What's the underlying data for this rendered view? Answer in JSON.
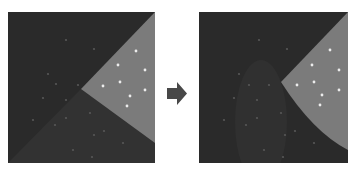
{
  "diagram": {
    "type": "before-after-transition",
    "colors": {
      "page_background": "#ffffff",
      "dark_region": "#2a2a2a",
      "dark_region_alt": "#323232",
      "wedge": "#7b7b7b",
      "bright_dot": "#ececec",
      "dim_dot": "#575757",
      "arrow": "#484848"
    },
    "left_panel": {
      "name": "before",
      "wedge_polygon": [
        [
          73,
          77
        ],
        [
          147,
          0
        ],
        [
          147,
          131
        ]
      ],
      "lower_region_polygon": [
        [
          0,
          151
        ],
        [
          73,
          77
        ],
        [
          147,
          131
        ],
        [
          147,
          151
        ]
      ],
      "bright_dots": [
        [
          128,
          39
        ],
        [
          110,
          53
        ],
        [
          137,
          58
        ],
        [
          95,
          74
        ],
        [
          112,
          70
        ],
        [
          137,
          78
        ],
        [
          122,
          84
        ],
        [
          119,
          94
        ]
      ],
      "dim_dots": [
        [
          58,
          28
        ],
        [
          86,
          37
        ],
        [
          40,
          62
        ],
        [
          48,
          72
        ],
        [
          70,
          73
        ],
        [
          58,
          88
        ],
        [
          35,
          86
        ],
        [
          82,
          101
        ],
        [
          58,
          106
        ],
        [
          47,
          113
        ],
        [
          96,
          119
        ],
        [
          86,
          123
        ],
        [
          115,
          131
        ],
        [
          65,
          138
        ],
        [
          84,
          145
        ],
        [
          25,
          108
        ]
      ]
    },
    "arrow": {
      "direction": "right",
      "label": ""
    },
    "right_panel": {
      "name": "after",
      "wedge_vertex": [
        82,
        70
      ],
      "wedge_curve_end": [
        149,
        138
      ],
      "blob_ellipse": {
        "cx": 62,
        "cy": 110,
        "rx": 26,
        "ry": 62
      },
      "bright_dots": [
        [
          131,
          38
        ],
        [
          113,
          53
        ],
        [
          140,
          58
        ],
        [
          98,
          73
        ],
        [
          115,
          70
        ],
        [
          140,
          78
        ],
        [
          123,
          83
        ],
        [
          121,
          93
        ]
      ],
      "dim_dots": [
        [
          60,
          28
        ],
        [
          88,
          37
        ],
        [
          40,
          62
        ],
        [
          50,
          73
        ],
        [
          70,
          73
        ],
        [
          58,
          88
        ],
        [
          35,
          86
        ],
        [
          82,
          101
        ],
        [
          58,
          106
        ],
        [
          47,
          113
        ],
        [
          96,
          119
        ],
        [
          86,
          123
        ],
        [
          115,
          131
        ],
        [
          65,
          138
        ],
        [
          84,
          145
        ],
        [
          25,
          108
        ]
      ]
    }
  }
}
